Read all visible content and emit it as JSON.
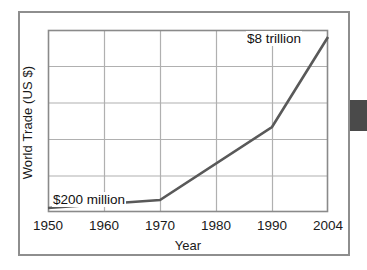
{
  "figure": {
    "y_axis_title": "World Trade (US $)",
    "x_axis_title": "Year",
    "x_tick_labels": [
      "1950",
      "1960",
      "1970",
      "1980",
      "1990",
      "2004"
    ],
    "annotations": {
      "low": "$200 million",
      "high": "$8 trillion"
    },
    "colors": {
      "line": "#595959",
      "grid": "#b0b0b0",
      "axis": "#6f6f6f",
      "frame": "#8e8e8e",
      "edge_tab": "#4a4a4a",
      "text": "#1a1a1a",
      "background": "#ffffff"
    }
  },
  "chart_data": {
    "type": "line",
    "title": "",
    "subtitle": "",
    "xlabel": "Year",
    "ylabel": "World Trade (US $)",
    "x": [
      1950,
      1970,
      1990,
      2004
    ],
    "x_tick_labels": [
      "1950",
      "1960",
      "1970",
      "1980",
      "1990",
      "2004"
    ],
    "x_tick_positions_px": [
      48,
      104,
      160,
      216,
      272,
      328
    ],
    "y_tick_labels": [],
    "grid": true,
    "grid_columns": 5,
    "grid_rows": 5,
    "legend": null,
    "series": [
      {
        "name": "World Trade (US $)",
        "points": [
          {
            "x": 1950,
            "y_px": 208,
            "label": "$200 million",
            "value_text": "$200 million"
          },
          {
            "x": 1970,
            "y_px": 200,
            "label": null,
            "value_text": null
          },
          {
            "x": 1990,
            "y_px": 127,
            "label": null,
            "value_text": null
          },
          {
            "x": 2004,
            "y_px": 37,
            "label": "$8 trillion",
            "value_text": "$8 trillion"
          }
        ]
      }
    ],
    "annotations": [
      {
        "text": "$200 million",
        "x": 1950,
        "anchor": "start"
      },
      {
        "text": "$8 trillion",
        "x": 2004,
        "anchor": "end"
      }
    ],
    "ylim_described": "unlabeled linear axis from near zero to above $8 trillion"
  }
}
